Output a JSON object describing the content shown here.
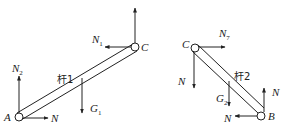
{
  "figure": {
    "left": {
      "rod_label": "杆1",
      "points": {
        "A": "A",
        "C": "C"
      },
      "forces": [
        {
          "id": "N2",
          "base": "N",
          "sub": "2",
          "at": "A",
          "direction": "up"
        },
        {
          "id": "N",
          "base": "N",
          "sub": "",
          "at": "A",
          "direction": "right"
        },
        {
          "id": "N1",
          "base": "N",
          "sub": "1",
          "at": "C",
          "direction": "left"
        },
        {
          "id": "up_C",
          "base": "",
          "sub": "",
          "at": "C",
          "direction": "up"
        },
        {
          "id": "G1",
          "base": "G",
          "sub": "1",
          "at": "center",
          "direction": "down"
        }
      ]
    },
    "right": {
      "rod_label": "杆2",
      "points": {
        "C": "C",
        "B": "B"
      },
      "forces": [
        {
          "id": "N7",
          "base": "N",
          "sub": "7",
          "at": "C",
          "direction": "right"
        },
        {
          "id": "N_C",
          "base": "N",
          "sub": "",
          "at": "C",
          "direction": "down"
        },
        {
          "id": "G2",
          "base": "G",
          "sub": "2",
          "at": "center",
          "direction": "down"
        },
        {
          "id": "N_B_up",
          "base": "N",
          "sub": "",
          "at": "B",
          "direction": "up"
        },
        {
          "id": "N_B_left",
          "base": "N",
          "sub": "",
          "at": "B",
          "direction": "left"
        }
      ]
    }
  }
}
